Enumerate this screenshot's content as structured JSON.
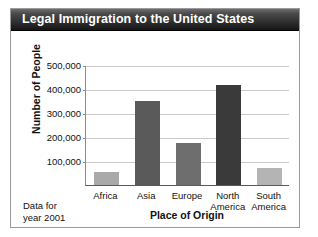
{
  "card": {
    "title": "Legal Immigration to the United States",
    "note_line1": "Data for",
    "note_line2": "year 2001"
  },
  "colors": {
    "title_bar_dark": "#161616",
    "title_bar_light": "#6e6e6e",
    "title_text": "#ffffff",
    "card_background": "#ffffff",
    "card_border": "#9a9a9a",
    "gridline": "#c9c9c9",
    "axis": "#5a5a5a",
    "text": "#111111"
  },
  "chart_data": {
    "type": "bar",
    "title": "Legal Immigration to the United States",
    "xlabel": "Place of Origin",
    "ylabel": "Number of People",
    "categories": [
      "Africa",
      "Asia",
      "Europe",
      "North America",
      "South America"
    ],
    "values": [
      55000,
      350000,
      175000,
      415000,
      70000
    ],
    "bar_colors": [
      "#a9a9a9",
      "#5a5a5a",
      "#6e6e6e",
      "#3a3a3a",
      "#b4b4b4"
    ],
    "ylim": [
      0,
      500000
    ],
    "ytick_values": [
      100000,
      200000,
      300000,
      400000,
      500000
    ],
    "ytick_labels": [
      "100,000",
      "200,000",
      "300,000",
      "400,000",
      "500,000"
    ],
    "grid": true,
    "legend": "none",
    "annotation": "Data for year 2001"
  }
}
